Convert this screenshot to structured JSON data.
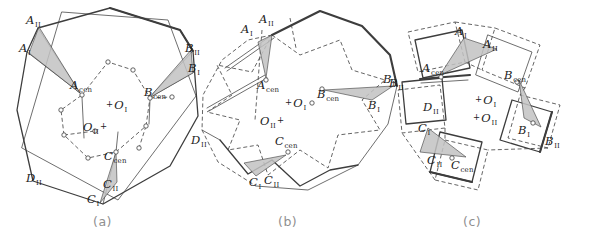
{
  "figure": {
    "background": "#ffffff",
    "line_color": "#3d3d3d",
    "shade_color": "#c2c2c2",
    "caption_color": "#8f8f8f",
    "label_color": "#1c1c1c"
  },
  "panels": [
    {
      "id": "a",
      "caption": "(a)",
      "labels": [
        {
          "main": "A",
          "sub": "II",
          "x": 26,
          "y": 14
        },
        {
          "main": "A",
          "sub": "I",
          "x": 19,
          "y": 42
        },
        {
          "main": "A",
          "sub": "cen",
          "x": 70,
          "y": 79
        },
        {
          "main": "B",
          "sub": "II",
          "x": 185,
          "y": 42
        },
        {
          "main": "B",
          "sub": "I",
          "x": 188,
          "y": 62
        },
        {
          "main": "B",
          "sub": "cen",
          "x": 144,
          "y": 86
        },
        {
          "main": "O",
          "sub": "I",
          "prefix": "+",
          "x": 105,
          "y": 99
        },
        {
          "main": "O",
          "sub": "II",
          "suffix": "+",
          "x": 83,
          "y": 121
        },
        {
          "main": "C",
          "sub": "cen",
          "x": 104,
          "y": 150
        },
        {
          "main": "D",
          "sub": "II",
          "x": 26,
          "y": 172
        },
        {
          "main": "C",
          "sub": "II",
          "x": 103,
          "y": 178
        },
        {
          "main": "C",
          "sub": "I",
          "x": 87,
          "y": 193
        }
      ]
    },
    {
      "id": "b",
      "caption": "(b)",
      "labels": [
        {
          "main": "A",
          "sub": "I",
          "x": 241,
          "y": 23
        },
        {
          "main": "A",
          "sub": "II",
          "x": 259,
          "y": 13
        },
        {
          "main": "A",
          "sub": "cen",
          "x": 257,
          "y": 79
        },
        {
          "main": "B",
          "sub": "II",
          "key": "B-II-right",
          "x": 383,
          "y": 73
        },
        {
          "main": "B",
          "sub": "cen",
          "x": 317,
          "y": 88
        },
        {
          "main": "B",
          "sub": "I",
          "key": "B-I-right",
          "x": 368,
          "y": 99
        },
        {
          "main": "O",
          "sub": "I",
          "prefix": "+",
          "x": 284,
          "y": 97
        },
        {
          "main": "O",
          "sub": "II",
          "suffix": "+",
          "x": 260,
          "y": 115
        },
        {
          "main": "D",
          "sub": "II",
          "x": 191,
          "y": 134
        },
        {
          "main": "C",
          "sub": "cen",
          "x": 275,
          "y": 135
        },
        {
          "main": "C",
          "sub": "I",
          "x": 249,
          "y": 176
        },
        {
          "main": "C",
          "sub": "II",
          "x": 264,
          "y": 174
        }
      ]
    },
    {
      "id": "c",
      "caption": "(c)",
      "labels": [
        {
          "main": "A",
          "sub": "I",
          "x": 455,
          "y": 25
        },
        {
          "main": "A",
          "sub": "II",
          "x": 483,
          "y": 38
        },
        {
          "main": "A",
          "sub": "cen",
          "x": 422,
          "y": 62
        },
        {
          "main": "B",
          "sub": "cen",
          "x": 504,
          "y": 69
        },
        {
          "main": "B",
          "sub": "II",
          "key": "B-II-left",
          "x": 389,
          "y": 77
        },
        {
          "main": "D",
          "sub": "II",
          "x": 423,
          "y": 101
        },
        {
          "main": "C",
          "sub": "I",
          "x": 418,
          "y": 122
        },
        {
          "main": "O",
          "sub": "I",
          "prefix": "+",
          "x": 474,
          "y": 94
        },
        {
          "main": "O",
          "sub": "II",
          "prefix": "+",
          "x": 472,
          "y": 112
        },
        {
          "main": "C",
          "sub": "II",
          "x": 427,
          "y": 154
        },
        {
          "main": "C",
          "sub": "cen",
          "x": 451,
          "y": 159
        },
        {
          "main": "B",
          "sub": "I",
          "key": "B-I-right",
          "x": 518,
          "y": 124
        },
        {
          "main": "B",
          "sub": "II",
          "key": "B-II-right",
          "x": 545,
          "y": 135
        }
      ]
    }
  ]
}
